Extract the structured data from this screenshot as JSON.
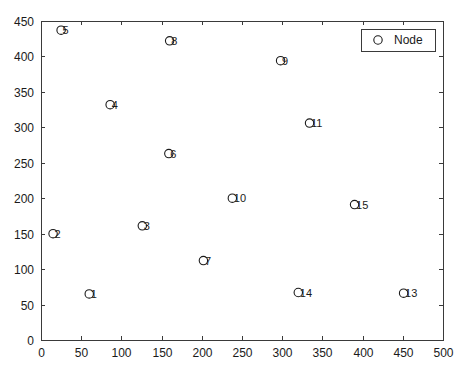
{
  "chart_data": {
    "type": "scatter",
    "title": "",
    "xlabel": "",
    "ylabel": "",
    "xlim": [
      0,
      500
    ],
    "ylim": [
      0,
      450
    ],
    "xticks": [
      0,
      50,
      100,
      150,
      200,
      250,
      300,
      350,
      400,
      450,
      500
    ],
    "yticks": [
      0,
      50,
      100,
      150,
      200,
      250,
      300,
      350,
      400,
      450
    ],
    "grid": false,
    "legend": {
      "position": "top-right",
      "entries": [
        {
          "label": "Node",
          "marker": "circle-open",
          "color": "#1a1a1a"
        }
      ]
    },
    "series": [
      {
        "name": "Node",
        "marker": "circle-open",
        "color": "#1a1a1a",
        "points": [
          {
            "label": "1",
            "x": 60,
            "y": 65
          },
          {
            "label": "2",
            "x": 15,
            "y": 150
          },
          {
            "label": "3",
            "x": 126,
            "y": 161
          },
          {
            "label": "4",
            "x": 86,
            "y": 332
          },
          {
            "label": "5",
            "x": 25,
            "y": 437
          },
          {
            "label": "6",
            "x": 159,
            "y": 263
          },
          {
            "label": "7",
            "x": 202,
            "y": 112
          },
          {
            "label": "8",
            "x": 160,
            "y": 422
          },
          {
            "label": "9",
            "x": 298,
            "y": 394
          },
          {
            "label": "10",
            "x": 238,
            "y": 200
          },
          {
            "label": "11",
            "x": 334,
            "y": 306
          },
          {
            "label": "13",
            "x": 451,
            "y": 66
          },
          {
            "label": "14",
            "x": 320,
            "y": 67
          },
          {
            "label": "15",
            "x": 390,
            "y": 191
          }
        ]
      }
    ]
  }
}
